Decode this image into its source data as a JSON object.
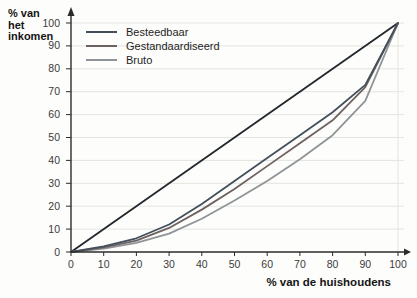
{
  "figure": {
    "y_axis_title_lines": [
      "% van",
      "het",
      "inkomen"
    ],
    "x_axis_title": "% van de huishoudens"
  },
  "chart_data": {
    "type": "line",
    "title": "",
    "xlabel": "% van de huishoudens",
    "ylabel": "% van het inkomen",
    "xlim": [
      0,
      100
    ],
    "ylim": [
      0,
      100
    ],
    "xticks": [
      0,
      10,
      20,
      30,
      40,
      50,
      60,
      70,
      80,
      90,
      100
    ],
    "yticks": [
      0,
      10,
      20,
      30,
      40,
      50,
      60,
      70,
      80,
      90,
      100
    ],
    "grid": "horizontal",
    "legend_position": "top-left-inside",
    "x": [
      0,
      10,
      20,
      30,
      40,
      50,
      60,
      70,
      80,
      90,
      100
    ],
    "series": [
      {
        "name": "Besteedbaar",
        "color": "#43505c",
        "values": [
          0,
          2.5,
          6,
          12,
          21,
          31,
          41,
          51,
          61,
          73,
          100
        ]
      },
      {
        "name": "Gestandaardiseerd",
        "color": "#6e6260",
        "values": [
          0,
          2,
          5,
          10.5,
          18.5,
          27.5,
          37.5,
          47.5,
          57.5,
          72,
          100
        ]
      },
      {
        "name": "Bruto",
        "color": "#8e9498",
        "values": [
          0,
          1.5,
          4,
          8,
          14.5,
          22.5,
          31,
          40.5,
          51,
          66,
          100
        ]
      }
    ],
    "diagonal": {
      "from": [
        0,
        0
      ],
      "to": [
        100,
        100
      ],
      "color": "#21272c"
    }
  },
  "colors": {
    "grid": "#e4e4e0",
    "axis": "#2b2b2b",
    "tick_text": "#3b3b3b",
    "paper": "#fdfdfb"
  }
}
